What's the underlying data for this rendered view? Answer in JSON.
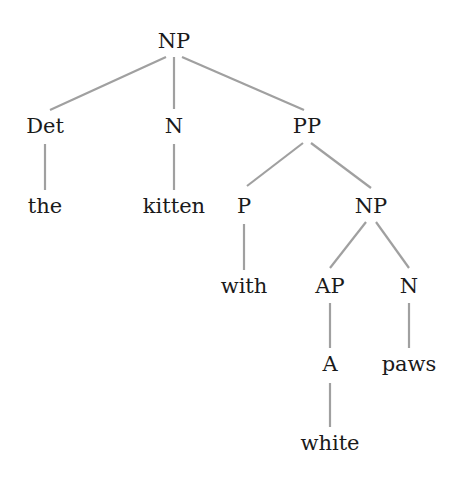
{
  "diagram": {
    "type": "syntax-tree",
    "edge_color": "#a0a0a0",
    "text_color": "#1a1a1a",
    "nodes": {
      "root_np": "NP",
      "det": "Det",
      "n1": "N",
      "pp": "PP",
      "the": "the",
      "kitten": "kitten",
      "p": "P",
      "np2": "NP",
      "with": "with",
      "ap": "AP",
      "n2": "N",
      "a": "A",
      "paws": "paws",
      "white": "white"
    },
    "edges": [
      [
        "NP",
        "Det"
      ],
      [
        "NP",
        "N"
      ],
      [
        "NP",
        "PP"
      ],
      [
        "Det",
        "the"
      ],
      [
        "N",
        "kitten"
      ],
      [
        "PP",
        "P"
      ],
      [
        "PP",
        "NP"
      ],
      [
        "P",
        "with"
      ],
      [
        "NP",
        "AP"
      ],
      [
        "NP",
        "N"
      ],
      [
        "AP",
        "A"
      ],
      [
        "N",
        "paws"
      ],
      [
        "A",
        "white"
      ]
    ]
  }
}
